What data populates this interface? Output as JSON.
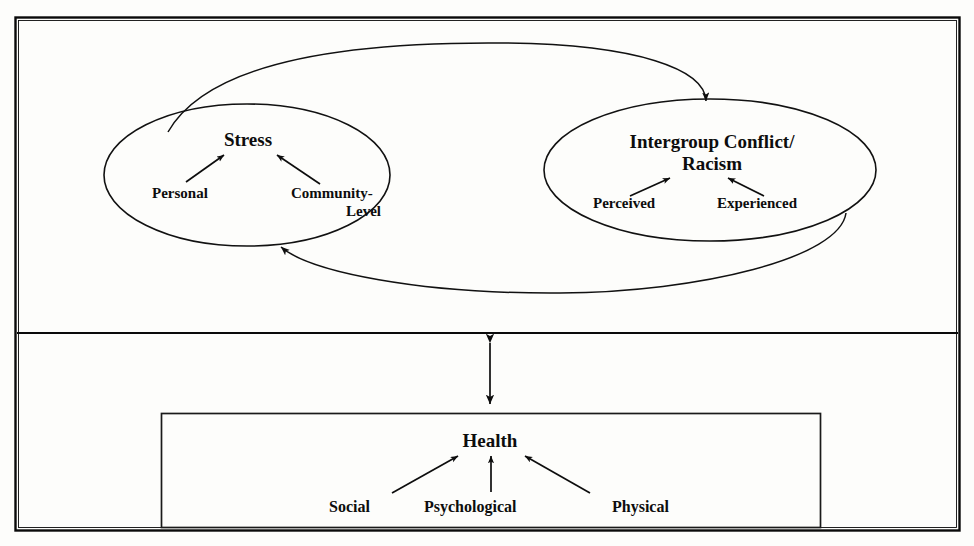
{
  "diagram": {
    "outer_frame": {
      "name": "outer-frame"
    },
    "upper_panel": {
      "name": "upper-panel",
      "nodes": [
        {
          "id": "stress",
          "label": "Stress",
          "shape": "ellipse",
          "sub_labels": [
            {
              "id": "personal",
              "label": "Personal"
            },
            {
              "id": "community-level",
              "label_line1": "Community-",
              "label_line2": "Level"
            }
          ]
        },
        {
          "id": "intergroup-conflict-racism",
          "label_line1": "Intergroup Conflict/",
          "label_line2": "Racism",
          "shape": "ellipse",
          "sub_labels": [
            {
              "id": "perceived",
              "label": "Perceived"
            },
            {
              "id": "experienced",
              "label": "Experienced"
            }
          ]
        }
      ],
      "connectors": [
        {
          "id": "stress-to-conflict",
          "from": "stress",
          "to": "intergroup-conflict-racism",
          "style": "curved-arc-top",
          "arrow": "single"
        },
        {
          "id": "conflict-to-stress",
          "from": "intergroup-conflict-racism",
          "to": "stress",
          "style": "curved-arc-bottom",
          "arrow": "single"
        }
      ]
    },
    "vertical_connector": {
      "id": "upper-to-health",
      "style": "straight",
      "arrow": "double"
    },
    "lower_panel": {
      "name": "lower-panel",
      "box": {
        "id": "health-box",
        "label": "Health",
        "sub_labels": [
          {
            "id": "social",
            "label": "Social"
          },
          {
            "id": "psychological",
            "label": "Psychological"
          },
          {
            "id": "physical",
            "label": "Physical"
          }
        ]
      }
    },
    "colors": {
      "ink": "#0d0d0d",
      "line": "#111111",
      "background": "#fdfdfb",
      "caption": "#6f6f6f"
    },
    "caption": {
      "text": ""
    }
  }
}
